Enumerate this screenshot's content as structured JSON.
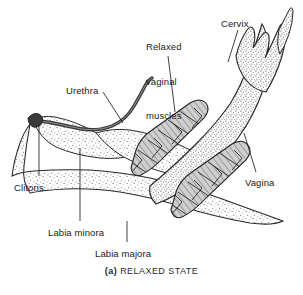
{
  "figure": {
    "caption_tag": "(a)",
    "caption_text": "RELAXED STATE",
    "background_color": "#ffffff",
    "ink_color": "#1a1a1a",
    "stipple_color": "#555555",
    "muscle_fill_color": "#c9c9c9"
  },
  "labels": [
    {
      "id": "relaxed-vaginal-muscles",
      "lines": [
        "Relaxed",
        "vaginal",
        "muscles"
      ],
      "text": "Relaxed vaginal muscles",
      "x": 146,
      "y": 18,
      "align": "left"
    },
    {
      "id": "cervix",
      "lines": [
        "Cervix"
      ],
      "text": "Cervix",
      "x": 221,
      "y": 18,
      "align": "left"
    },
    {
      "id": "urethra",
      "lines": [
        "Urethra"
      ],
      "text": "Urethra",
      "x": 66,
      "y": 85,
      "align": "left"
    },
    {
      "id": "vagina",
      "lines": [
        "Vagina"
      ],
      "text": "Vagina",
      "x": 245,
      "y": 177,
      "align": "left"
    },
    {
      "id": "clitoris",
      "lines": [
        "Clitoris"
      ],
      "text": "Clitoris",
      "x": 14,
      "y": 182,
      "align": "left"
    },
    {
      "id": "labia-minora",
      "lines": [
        "Labia minora"
      ],
      "text": "Labia minora",
      "x": 48,
      "y": 227,
      "align": "left"
    },
    {
      "id": "labia-majora",
      "lines": [
        "Labia majora"
      ],
      "text": "Labia majora",
      "x": 95,
      "y": 248,
      "align": "left"
    }
  ],
  "leaders": [
    {
      "id": "leader-relaxed-vaginal-muscles",
      "points": "168,56 175,112"
    },
    {
      "id": "leader-cervix",
      "points": "238,30 228,62"
    },
    {
      "id": "leader-urethra",
      "points": "103,92 123,123"
    },
    {
      "id": "leader-vagina",
      "points": "244,133 256,172"
    },
    {
      "id": "leader-clitoris",
      "points": "39,124 39,176"
    },
    {
      "id": "leader-labia-minora",
      "points": "80,148 80,221"
    },
    {
      "id": "leader-labia-majora",
      "points": "127,221 127,242"
    }
  ],
  "structures": [
    {
      "id": "vaginal-canal",
      "name": "vaginal canal"
    },
    {
      "id": "cervix-body",
      "name": "cervix with fornices"
    },
    {
      "id": "urethra-tube",
      "name": "urethral tube"
    },
    {
      "id": "muscle-bundle-upper",
      "name": "upper relaxed vaginal muscle bundle"
    },
    {
      "id": "muscle-bundle-lower",
      "name": "lower relaxed vaginal muscle bundle"
    },
    {
      "id": "labia-majora-fold",
      "name": "labia majora fold"
    },
    {
      "id": "labia-minora-fold",
      "name": "labia minora fold"
    },
    {
      "id": "clitoris-tip",
      "name": "clitoris"
    }
  ]
}
